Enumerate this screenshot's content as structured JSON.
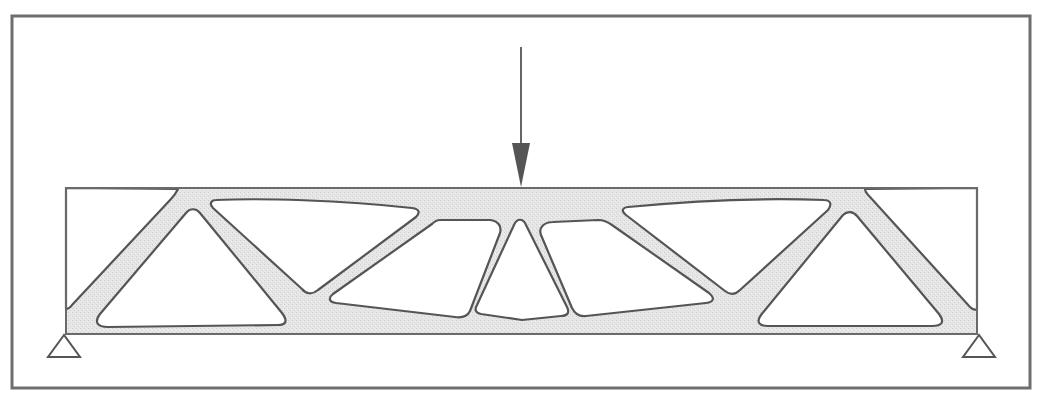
{
  "figure": {
    "colors": {
      "background": "#ffffff",
      "material_fill": "#e4e4e4",
      "outline": "#555555",
      "frame": "#6e6e6e"
    },
    "frame": {
      "x": 12,
      "y": 16,
      "width": 1018,
      "height": 372
    },
    "beam": {
      "x": 66,
      "y": 188,
      "width": 911,
      "height": 146
    },
    "load": {
      "type": "point-load-arrow",
      "x": 521,
      "y_start": 47,
      "y_end": 187,
      "direction": "down"
    },
    "supports": [
      {
        "name": "left-support",
        "type": "pin-triangle",
        "apex": [
          64,
          335
        ],
        "base_left": [
          47,
          357
        ],
        "base_right": [
          81,
          357
        ]
      },
      {
        "name": "right-support",
        "type": "pin-triangle",
        "apex": [
          979,
          335
        ],
        "base_left": [
          963,
          357
        ],
        "base_right": [
          996,
          357
        ]
      }
    ],
    "holes": [
      {
        "name": "left-corner-void"
      },
      {
        "name": "left-triangle-hole"
      },
      {
        "name": "upper-left-hole"
      },
      {
        "name": "center-left-hole"
      },
      {
        "name": "center-triangle-hole"
      },
      {
        "name": "center-right-hole"
      },
      {
        "name": "upper-right-hole"
      },
      {
        "name": "right-triangle-hole"
      },
      {
        "name": "right-corner-void"
      }
    ]
  }
}
